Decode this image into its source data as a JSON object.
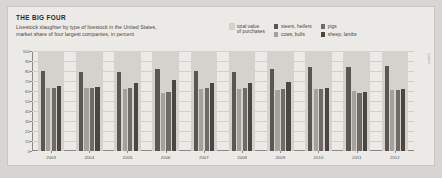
{
  "header": {
    "title": "THE BIG FOUR",
    "subtitle_line1": "Livestock slaughter by type of livestock in the United States,",
    "subtitle_line2": "market share of four largest companies, in percent"
  },
  "legend": {
    "items": [
      {
        "label": "total value\nof purchases",
        "color": "#d5d2cd"
      },
      {
        "label": "steers, heifers",
        "color": "#5a5753"
      },
      {
        "label": "cows, bulls",
        "color": "#a4a19c"
      },
      {
        "label": "pigs",
        "color": "#6e6b67"
      },
      {
        "label": "sheep, lambs",
        "color": "#4a4743"
      }
    ]
  },
  "chart_data": {
    "type": "bar",
    "title": "THE BIG FOUR",
    "subtitle": "Livestock slaughter by type of livestock in the United States, market share of four largest companies, in percent",
    "xlabel": "",
    "ylabel": "percent",
    "ylim": [
      0,
      100
    ],
    "yticks": [
      0,
      10,
      20,
      30,
      40,
      50,
      60,
      70,
      80,
      90,
      100
    ],
    "grid": true,
    "legend_position": "top-right",
    "categories": [
      "2003",
      "2004",
      "2005",
      "2006",
      "2007",
      "2008",
      "2009",
      "2010",
      "2011",
      "2012"
    ],
    "series": [
      {
        "name": "steers, heifers",
        "color": "#5a5753",
        "values": [
          80,
          79,
          79,
          82,
          80,
          79,
          82,
          84,
          84,
          85
        ]
      },
      {
        "name": "cows, bulls",
        "color": "#a4a19c",
        "values": [
          63,
          63,
          62,
          58,
          62,
          62,
          61,
          62,
          60,
          61
        ]
      },
      {
        "name": "pigs",
        "color": "#6e6b67",
        "values": [
          63,
          63,
          63,
          59,
          63,
          63,
          62,
          62,
          58,
          61
        ]
      },
      {
        "name": "sheep, lambs",
        "color": "#4a4743",
        "values": [
          65,
          64,
          68,
          71,
          68,
          68,
          69,
          63,
          59,
          62
        ]
      }
    ]
  },
  "credit": "source"
}
